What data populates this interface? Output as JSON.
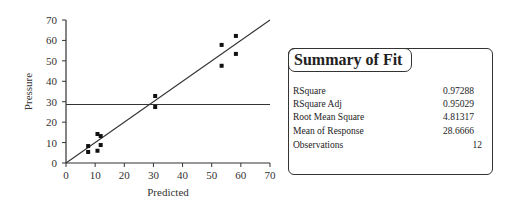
{
  "chart_data": {
    "type": "scatter",
    "title": "",
    "xlabel": "Predicted",
    "ylabel": "Pressure",
    "xlim": [
      0,
      70
    ],
    "ylim": [
      0,
      70
    ],
    "x_ticks": [
      "0",
      "10",
      "20",
      "30",
      "40",
      "50",
      "60",
      "70"
    ],
    "y_ticks": [
      "0",
      "10",
      "20",
      "30",
      "40",
      "50",
      "60",
      "70"
    ],
    "grid": false,
    "points": [
      {
        "x": 7.6,
        "y": 8.3
      },
      {
        "x": 7.6,
        "y": 5.4
      },
      {
        "x": 10.8,
        "y": 14.2
      },
      {
        "x": 11.9,
        "y": 13.2
      },
      {
        "x": 11.9,
        "y": 8.8
      },
      {
        "x": 10.8,
        "y": 6.0
      },
      {
        "x": 30.6,
        "y": 32.8
      },
      {
        "x": 30.6,
        "y": 27.4
      },
      {
        "x": 53.4,
        "y": 57.8
      },
      {
        "x": 53.4,
        "y": 47.6
      },
      {
        "x": 58.3,
        "y": 62.2
      },
      {
        "x": 58.3,
        "y": 53.4
      }
    ],
    "reference_lines": [
      {
        "type": "diagonal",
        "from": [
          0,
          0
        ],
        "to": [
          70,
          70
        ]
      },
      {
        "type": "horizontal_mean",
        "y": 28.6666
      }
    ]
  },
  "summary": {
    "title": "Summary of Fit",
    "rows": [
      {
        "label": "RSquare",
        "value": "0.97288"
      },
      {
        "label": "RSquare Adj",
        "value": "0.95029"
      },
      {
        "label": "Root Mean Square",
        "value": "4.81317"
      },
      {
        "label": "Mean of Response",
        "value": "28.6666"
      },
      {
        "label": "Observations",
        "value": "12"
      }
    ]
  }
}
